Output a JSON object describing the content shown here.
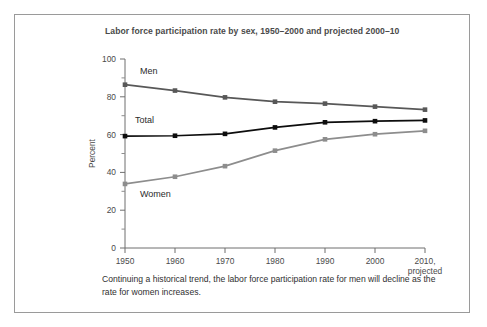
{
  "figure": {
    "title": "Labor force participation rate by sex, 1950–2000 and projected 2000–10",
    "caption": "Continuing a historical trend, the labor force participation rate for men will decline as the rate for women increases.",
    "border_color": "#9a9a9a"
  },
  "chart_data": {
    "type": "line",
    "title": "Labor force participation rate by sex, 1950–2000 and projected 2000–10",
    "xlabel": "",
    "ylabel": "Percent",
    "categories": [
      "1950",
      "1960",
      "1970",
      "1980",
      "1990",
      "2000",
      "2010,\nprojected"
    ],
    "x": [
      1950,
      1960,
      1970,
      1980,
      1990,
      2000,
      2010
    ],
    "xtick_labels": [
      "1950",
      "1960",
      "1970",
      "1980",
      "1990",
      "2000",
      "2010,"
    ],
    "xtick_sublabel_last": "projected",
    "xlim": [
      1950,
      2010
    ],
    "ylim": [
      0,
      100
    ],
    "ytick_labels": [
      "0",
      "20",
      "40",
      "60",
      "80",
      "100"
    ],
    "yticks": [
      0,
      20,
      40,
      60,
      80,
      100
    ],
    "yticks_minor": [
      10,
      30,
      50,
      70,
      90
    ],
    "grid": false,
    "legend": "inline-labels",
    "series": [
      {
        "name": "Men",
        "color": "#585858",
        "label_x": 1953,
        "label_y": 92,
        "values": [
          86.4,
          83.3,
          79.7,
          77.4,
          76.4,
          74.8,
          73.2
        ]
      },
      {
        "name": "Total",
        "color": "#0d0d0d",
        "label_x": 1952,
        "label_y": 66,
        "values": [
          59.2,
          59.4,
          60.4,
          63.8,
          66.5,
          67.1,
          67.5
        ]
      },
      {
        "name": "Women",
        "color": "#8d8d8d",
        "label_x": 1953,
        "label_y": 27,
        "values": [
          33.9,
          37.7,
          43.3,
          51.5,
          57.5,
          60.2,
          62.0
        ]
      }
    ]
  },
  "axis": {
    "y_title": "Percent",
    "tick_color": "#6f6f6f"
  }
}
